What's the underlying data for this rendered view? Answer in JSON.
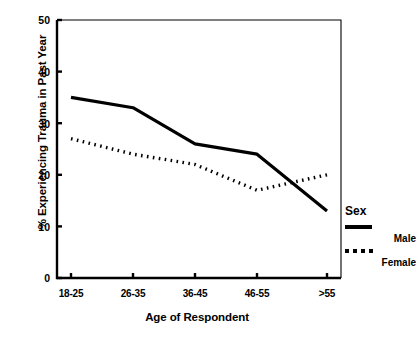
{
  "chart_data": {
    "type": "line",
    "title": "",
    "xlabel": "Age of Respondent",
    "ylabel": "% Experiencing Trauma in Past Year",
    "categories": [
      "18-25",
      "26-35",
      "36-45",
      "46-55",
      ">55"
    ],
    "ylim": [
      0,
      50
    ],
    "yticks": [
      0,
      10,
      20,
      30,
      40,
      50
    ],
    "ytick_labels": [
      "0",
      "10",
      "20",
      "30",
      "40",
      "50"
    ],
    "grid": false,
    "legend_position": "right",
    "legend_title": "Sex",
    "series": [
      {
        "name": "Male",
        "style": "solid",
        "color": "#000000",
        "values": [
          35,
          33,
          26,
          24,
          13
        ]
      },
      {
        "name": "Female",
        "style": "dotted",
        "color": "#000000",
        "values": [
          27,
          24,
          22,
          17,
          20
        ]
      }
    ]
  },
  "axes": {
    "y_title": "% Experiencing Trauma in Past Year",
    "x_title": "Age of Respondent",
    "y_tick_labels": [
      "50",
      "40",
      "30",
      "20",
      "10",
      "0"
    ],
    "x_tick_labels": [
      "18-25",
      "26-35",
      "36-45",
      "46-55",
      ">55"
    ]
  },
  "legend": {
    "title": "Sex",
    "entries": [
      {
        "label": "Male",
        "style": "solid"
      },
      {
        "label": "Female",
        "style": "dotted"
      }
    ]
  }
}
